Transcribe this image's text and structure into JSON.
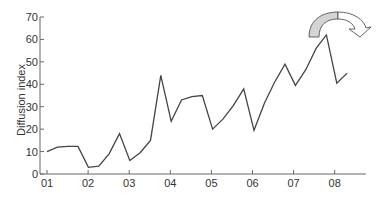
{
  "chart_data": {
    "type": "line",
    "title": "",
    "xlabel": "",
    "ylabel": "Diffusion index",
    "ylim": [
      0,
      70
    ],
    "yticks": [
      0,
      10,
      20,
      30,
      40,
      50,
      60,
      70
    ],
    "xtick_labels": [
      "01",
      "02",
      "03",
      "04",
      "05",
      "06",
      "07",
      "08"
    ],
    "grid": false,
    "legend": null,
    "x_frequency": "quarterly",
    "series": [
      {
        "name": "Diffusion index",
        "color": "#444444",
        "values": [
          10,
          12,
          12.3,
          12.3,
          3,
          3.5,
          9,
          18,
          6,
          9.5,
          15,
          44,
          23.5,
          33,
          34.5,
          35,
          20,
          24.5,
          30.5,
          38,
          19.5,
          31.5,
          41,
          49,
          39.5,
          46.5,
          56,
          62,
          40.5,
          45
        ]
      }
    ],
    "annotations": [
      {
        "type": "curved-arrow",
        "description": "Curved arrow at top right pointing down and to the right",
        "fill": "#d4d4d4"
      }
    ]
  }
}
